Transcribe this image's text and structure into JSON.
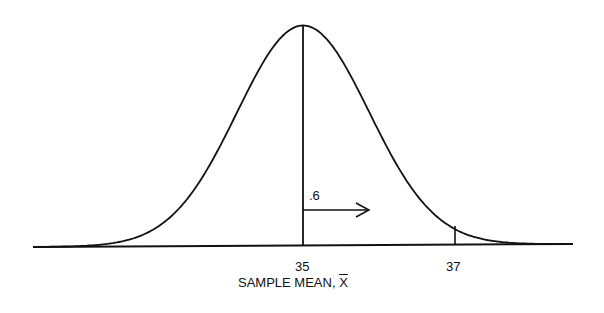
{
  "chart_data": {
    "type": "line",
    "title": "",
    "xlabel": "SAMPLE MEAN, X̄",
    "xlabel_prefix": "SAMPLE MEAN, ",
    "xlabel_symbol": "X",
    "ylabel": "",
    "distribution": {
      "family": "normal",
      "mean": 35,
      "std_error": 0.86
    },
    "tick_labels": [
      "35",
      "37"
    ],
    "ticks": [
      35,
      37
    ],
    "annotations": [
      {
        "type": "vertical_line",
        "x": 35,
        "label": "mean"
      },
      {
        "type": "arrow",
        "from": 35,
        "length": 0.6,
        "label": ".6"
      },
      {
        "type": "tick_mark",
        "x": 37
      }
    ],
    "grid": false,
    "legend": null
  },
  "labels": {
    "arrow_label": ".6",
    "tick_35": "35",
    "tick_37": "37",
    "x_axis_prefix": "SAMPLE MEAN, ",
    "x_axis_symbol": "X"
  }
}
